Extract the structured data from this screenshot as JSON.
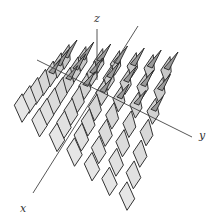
{
  "diagram": {
    "type": "3d-surface-normal-tiles",
    "axes": [
      {
        "name": "x",
        "label": "x",
        "from": [
          138,
          26
        ],
        "to": [
          33,
          193
        ],
        "label_pos": [
          20,
          202
        ]
      },
      {
        "name": "y",
        "label": "y",
        "from": [
          37,
          60
        ],
        "to": [
          192,
          137
        ],
        "label_pos": [
          199,
          129
        ]
      },
      {
        "name": "z",
        "label": "z",
        "from": [
          97,
          80
        ],
        "to": [
          97,
          29
        ],
        "label_pos": [
          94,
          12
        ]
      }
    ],
    "grid": {
      "rows": 7,
      "cols": 7,
      "corners": {
        "far_left": [
          65,
          60
        ],
        "far_right": [
          166,
          72
        ],
        "near_left": [
          22,
          108
        ],
        "near_right": [
          127,
          196
        ]
      },
      "tile_fill": "#d9d9d9",
      "tile_stroke": "#333333"
    },
    "colors": {
      "axis": "#444444",
      "tile_fill_near": "#e4e4e4",
      "tile_fill_far": "#c8c8c8",
      "tile_stroke": "#333333"
    }
  }
}
